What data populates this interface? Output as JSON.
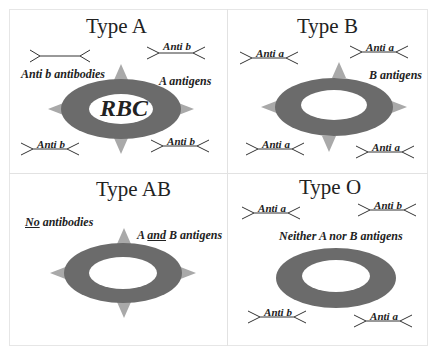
{
  "colors": {
    "membrane": "#6b6b6b",
    "antigen": "#a9a9a9",
    "line": "#333333",
    "grid": "#e2e2e2"
  },
  "panels": [
    {
      "id": "type-a",
      "title": "Type A",
      "antibody_note": "Anti b antibodies",
      "antigen_note": "A antigens",
      "cell_label": "RBC",
      "antigens_shown": true,
      "antibodies": [
        "Anti b",
        "Anti b",
        "Anti b"
      ]
    },
    {
      "id": "type-b",
      "title": "Type B",
      "antigen_note": "B antigens",
      "antigens_shown": true,
      "antibodies": [
        "Anti a",
        "Anti a",
        "Anti a",
        "Anti a"
      ]
    },
    {
      "id": "type-ab",
      "title": "Type AB",
      "antibody_note_underlined": "No",
      "antibody_note_rest": " antibodies",
      "antigen_note_pre": "A ",
      "antigen_note_underlined": "and",
      "antigen_note_post": " B antigens",
      "antigens_shown": true,
      "antibodies": []
    },
    {
      "id": "type-o",
      "title": "Type O",
      "antigen_note": "Neither A nor B antigens",
      "antigens_shown": false,
      "antibodies": [
        "Anti a",
        "Anti b",
        "Anti b",
        "Anti a"
      ]
    }
  ]
}
